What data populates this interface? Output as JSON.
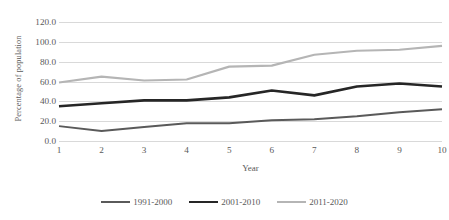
{
  "chart_data": {
    "type": "line",
    "title": "",
    "xlabel": "Year",
    "ylabel": "Percentage of population",
    "x": [
      1,
      2,
      3,
      4,
      5,
      6,
      7,
      8,
      9,
      10
    ],
    "categories": [
      "1",
      "2",
      "3",
      "4",
      "5",
      "6",
      "7",
      "8",
      "9",
      "10"
    ],
    "ylim": [
      0,
      120
    ],
    "ytick_labels": [
      "0.0",
      "20.0",
      "40.0",
      "60.0",
      "80.0",
      "100.0",
      "120.0"
    ],
    "ytick_values": [
      0,
      20,
      40,
      60,
      80,
      100,
      120
    ],
    "grid": "horizontal",
    "legend_position": "bottom",
    "series": [
      {
        "name": "1991-2000",
        "color": "#5a5a5a",
        "width": 2.0,
        "values": [
          15,
          10,
          14,
          18,
          18,
          21,
          22,
          25,
          29,
          32
        ]
      },
      {
        "name": "2001-2010",
        "color": "#262626",
        "width": 2.6,
        "values": [
          35,
          38,
          41,
          41,
          44,
          51,
          46,
          55,
          58,
          55
        ]
      },
      {
        "name": "2011-2020",
        "color": "#b5b5b5",
        "width": 2.2,
        "values": [
          59,
          65,
          61,
          62,
          75,
          76,
          87,
          91,
          92,
          96
        ]
      }
    ]
  }
}
